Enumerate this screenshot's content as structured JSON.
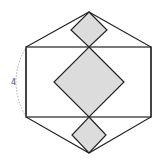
{
  "diagram": {
    "title": "",
    "dimension_label": "4",
    "colors": {
      "stroke": "#222222",
      "fill": "#dcdcdc",
      "dash": "#999999"
    },
    "hexagon": [
      [
        89,
        12
      ],
      [
        151,
        47
      ],
      [
        151,
        117
      ],
      [
        89,
        153
      ],
      [
        26,
        117
      ],
      [
        26,
        47
      ]
    ],
    "rectangle": {
      "x": 26,
      "y": 47,
      "w": 125,
      "h": 70
    },
    "diamonds": [
      {
        "name": "top",
        "points": [
          [
            89,
            12
          ],
          [
            107,
            30
          ],
          [
            89,
            47
          ],
          [
            71,
            30
          ]
        ]
      },
      {
        "name": "center",
        "points": [
          [
            89,
            47
          ],
          [
            124,
            82
          ],
          [
            89,
            117
          ],
          [
            54,
            82
          ]
        ]
      },
      {
        "name": "bottom",
        "points": [
          [
            89,
            117
          ],
          [
            106,
            135
          ],
          [
            89,
            153
          ],
          [
            72,
            135
          ]
        ]
      }
    ]
  }
}
